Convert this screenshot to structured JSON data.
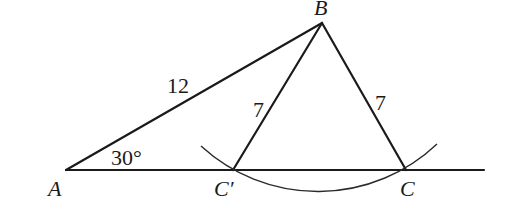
{
  "diagram": {
    "type": "geometry-ambiguous-case-SSA",
    "points": {
      "A": {
        "label": "A",
        "x": 66,
        "y": 170
      },
      "B": {
        "label": "B",
        "x": 322,
        "y": 23
      },
      "C_prime": {
        "label": "C′",
        "x": 233,
        "y": 170
      },
      "C": {
        "label": "C",
        "x": 406,
        "y": 170
      }
    },
    "baseline_end": {
      "x": 484,
      "y": 170
    },
    "segments": [
      {
        "from": "A",
        "to": "B",
        "label": "12"
      },
      {
        "from": "B",
        "to": "C_prime",
        "label": "7"
      },
      {
        "from": "B",
        "to": "C",
        "label": "7"
      },
      {
        "from": "A",
        "to": "baseline_end",
        "label": ""
      }
    ],
    "angle": {
      "vertex": "A",
      "label": "30°"
    },
    "arc": {
      "center": "B",
      "radius_label": "7"
    },
    "labels": {
      "A": "A",
      "B": "B",
      "C_prime": "C′",
      "C": "C",
      "AB": "12",
      "BC_prime": "7",
      "BC": "7",
      "angle_A": "30°"
    }
  }
}
